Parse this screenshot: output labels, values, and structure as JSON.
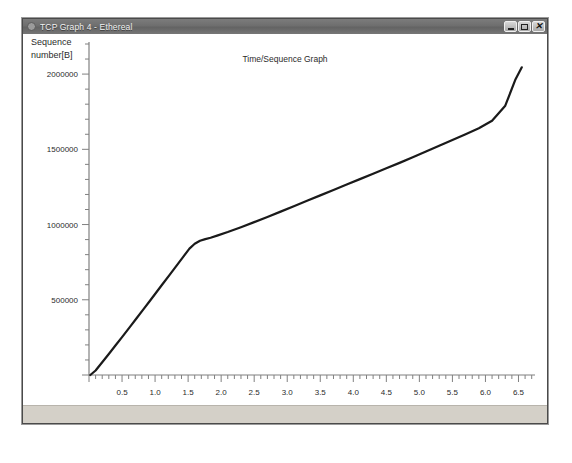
{
  "window": {
    "title": "TCP Graph 4 - Ethereal",
    "icon": "app-icon",
    "buttons": {
      "minimize": "minimize",
      "maximize": "maximize",
      "close": "close"
    }
  },
  "statusbar": {
    "text": ""
  },
  "chart_data": {
    "type": "line",
    "title": "Time/Sequence Graph",
    "xlabel": "",
    "ylabel": "Sequence number[B]",
    "ylabel_lines": [
      "Sequence",
      "number[B]"
    ],
    "xlim": [
      0,
      6.75
    ],
    "ylim": [
      0,
      2200000
    ],
    "grid": false,
    "legend": false,
    "x_major_step": 0.5,
    "x_minor_per_major": 5,
    "y_major_step": 500000,
    "y_minor_per_major": 5,
    "xticks": [
      0.5,
      1.0,
      1.5,
      2.0,
      2.5,
      3.0,
      3.5,
      4.0,
      4.5,
      5.0,
      5.5,
      6.0,
      6.5
    ],
    "xticklabels": [
      "0.5",
      "1.0",
      "1.5",
      "2.0",
      "2.5",
      "3.0",
      "3.5",
      "4.0",
      "4.5",
      "5.0",
      "5.5",
      "6.0",
      "6.5"
    ],
    "yticks": [
      500000,
      1000000,
      1500000,
      2000000
    ],
    "yticklabels": [
      "500000",
      "1000000",
      "1500000",
      "2000000"
    ],
    "series": [
      {
        "name": "sequence",
        "color": "#1a1a1a",
        "x": [
          0.02,
          0.1,
          0.2,
          0.3,
          0.4,
          0.5,
          0.62,
          0.72,
          0.82,
          0.92,
          1.02,
          1.12,
          1.22,
          1.32,
          1.42,
          1.52,
          1.6,
          1.68,
          1.76,
          1.84,
          1.95,
          2.1,
          2.3,
          2.5,
          2.7,
          2.9,
          3.1,
          3.3,
          3.5,
          3.7,
          3.9,
          4.1,
          4.3,
          4.5,
          4.7,
          4.9,
          5.1,
          5.3,
          5.5,
          5.7,
          5.9,
          6.1,
          6.3,
          6.45,
          6.55
        ],
        "y": [
          0,
          30000,
          85000,
          140000,
          196000,
          252000,
          320000,
          377000,
          434000,
          492000,
          550000,
          608000,
          666000,
          724000,
          782000,
          840000,
          872000,
          892000,
          903000,
          912000,
          928000,
          950000,
          982000,
          1016000,
          1050000,
          1086000,
          1122000,
          1158000,
          1194000,
          1230000,
          1266000,
          1302000,
          1338000,
          1374000,
          1410000,
          1448000,
          1486000,
          1524000,
          1562000,
          1600000,
          1640000,
          1690000,
          1790000,
          1960000,
          2045000
        ]
      }
    ]
  },
  "colors": {
    "curve": "#1a1a1a",
    "axis": "#808080",
    "text": "#2b2b2b",
    "statusbar": "#d4d0c8",
    "titlebar": "#6e6e6e"
  }
}
